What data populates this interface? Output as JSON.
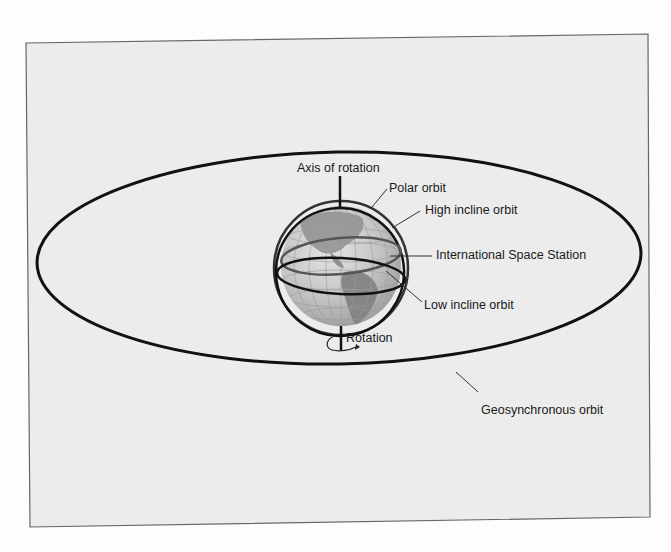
{
  "diagram": {
    "type": "orbit-diagram",
    "labels": {
      "axis": "Axis of rotation",
      "polar": "Polar orbit",
      "high_incline": "High incline orbit",
      "iss": "International Space Station",
      "low_incline": "Low incline orbit",
      "rotation": "Rotation",
      "geosynchronous": "Geosynchronous orbit"
    },
    "colors": {
      "background": "#ececec",
      "frame": "#555555",
      "orbit_line": "#111111",
      "globe": "#bdbdbd",
      "land": "#8a8a8a"
    }
  }
}
